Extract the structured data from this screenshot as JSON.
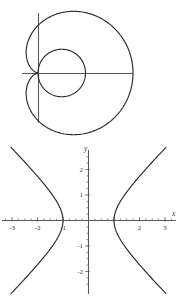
{
  "figures": [
    {
      "id": "polar-limacon",
      "name": "cardioid-and-circle",
      "axis_labels": {
        "x": "",
        "y": ""
      },
      "chart_data": {
        "type": "line",
        "title": "",
        "subtitle": "",
        "xlabel": "",
        "ylabel": "",
        "coordinate_system": "polar",
        "grid": false,
        "legend": false,
        "axes_shown": [
          "x-axis",
          "y-axis"
        ],
        "origin_px": [
          38,
          73
        ],
        "xlim": [
          -0.55,
          2.05
        ],
        "ylim": [
          -1.35,
          1.35
        ],
        "series": [
          {
            "name": "cardioid",
            "equation": "r = 1 + cos(theta)",
            "r_max": 2.0,
            "cusp_at": [
              0,
              0
            ],
            "points_polar": [
              [
                0,
                2.0
              ],
              [
                15,
                1.966
              ],
              [
                30,
                1.866
              ],
              [
                45,
                1.707
              ],
              [
                60,
                1.5
              ],
              [
                75,
                1.259
              ],
              [
                90,
                1.0
              ],
              [
                105,
                0.741
              ],
              [
                120,
                0.5
              ],
              [
                135,
                0.293
              ],
              [
                150,
                0.134
              ],
              [
                165,
                0.034
              ],
              [
                180,
                0.0
              ],
              [
                195,
                0.034
              ],
              [
                210,
                0.134
              ],
              [
                225,
                0.293
              ],
              [
                240,
                0.5
              ],
              [
                255,
                0.741
              ],
              [
                270,
                1.0
              ],
              [
                285,
                1.259
              ],
              [
                300,
                1.5
              ],
              [
                315,
                1.707
              ],
              [
                330,
                1.866
              ],
              [
                345,
                1.966
              ],
              [
                360,
                2.0
              ]
            ]
          },
          {
            "name": "circle",
            "equation": "r = cos(theta)",
            "r_max": 1.0,
            "diameter": 1.0,
            "center": [
              0.5,
              0
            ],
            "points_polar": [
              [
                0,
                1.0
              ],
              [
                20,
                0.94
              ],
              [
                40,
                0.766
              ],
              [
                60,
                0.5
              ],
              [
                80,
                0.174
              ],
              [
                90,
                0.0
              ],
              [
                100,
                -0.174
              ],
              [
                120,
                -0.5
              ],
              [
                140,
                -0.766
              ],
              [
                160,
                -0.94
              ],
              [
                180,
                -1.0
              ]
            ]
          }
        ]
      }
    },
    {
      "id": "hyperbola",
      "name": "hyperbola-plot",
      "axis_labels": {
        "x": "x",
        "y": "y"
      },
      "chart_data": {
        "type": "line",
        "title": "",
        "subtitle": "",
        "xlabel": "x",
        "ylabel": "y",
        "coordinate_system": "cartesian",
        "grid": false,
        "legend": false,
        "origin_px": [
          88,
          220
        ],
        "px_per_unit_x": 25.5,
        "px_per_unit_y": 25.5,
        "xlim": [
          -3.4,
          3.4
        ],
        "ylim": [
          -2.75,
          2.75
        ],
        "x_ticks": [
          -3,
          -2,
          -1,
          1,
          2,
          3
        ],
        "x_tick_labels": [
          "-3",
          "-2",
          "-1",
          "",
          "2",
          "3"
        ],
        "x_minor_ticks": true,
        "y_ticks": [
          -2,
          -1,
          1,
          2
        ],
        "y_tick_labels": [
          "-2",
          "-1",
          "1",
          "2"
        ],
        "y_minor_ticks": true,
        "series": [
          {
            "name": "right-branch",
            "equation": "x^2 - y^2 = 1, x >= 1",
            "vertex": [
              1,
              0
            ],
            "points": [
              [
                2.95,
                -2.78
              ],
              [
                2.5,
                -2.29
              ],
              [
                2.0,
                -1.73
              ],
              [
                1.6,
                -1.25
              ],
              [
                1.35,
                -0.91
              ],
              [
                1.15,
                -0.57
              ],
              [
                1.05,
                -0.32
              ],
              [
                1.0,
                0.0
              ],
              [
                1.05,
                0.32
              ],
              [
                1.15,
                0.57
              ],
              [
                1.35,
                0.91
              ],
              [
                1.6,
                1.25
              ],
              [
                2.0,
                1.73
              ],
              [
                2.5,
                2.29
              ],
              [
                2.95,
                2.78
              ]
            ]
          },
          {
            "name": "left-branch",
            "equation": "x^2 - y^2 = 1, x <= -1",
            "vertex": [
              -1,
              0
            ],
            "points": [
              [
                -2.95,
                -2.78
              ],
              [
                -2.5,
                -2.29
              ],
              [
                -2.0,
                -1.73
              ],
              [
                -1.6,
                -1.25
              ],
              [
                -1.35,
                -0.91
              ],
              [
                -1.15,
                -0.57
              ],
              [
                -1.05,
                -0.32
              ],
              [
                -1.0,
                0.0
              ],
              [
                -1.05,
                0.32
              ],
              [
                -1.15,
                0.57
              ],
              [
                -1.35,
                0.91
              ],
              [
                -1.6,
                1.25
              ],
              [
                -2.0,
                1.73
              ],
              [
                -2.5,
                2.29
              ],
              [
                -2.95,
                2.78
              ]
            ]
          }
        ]
      }
    }
  ]
}
